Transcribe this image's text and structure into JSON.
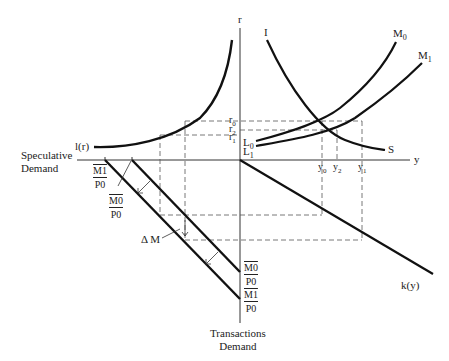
{
  "diagram": {
    "axes": {
      "vertical_top_label": "r",
      "horizontal_right_label": "y",
      "left_caption": [
        "Speculative",
        "Demand"
      ],
      "bottom_caption": [
        "Transactions",
        "Demand"
      ]
    },
    "curves": {
      "liquidity_pref": "l(r)",
      "investment": "I",
      "saving": "S",
      "money_0": "M",
      "money_0_sub": "0",
      "money_1": "M",
      "money_1_sub": "1",
      "lm0": "L",
      "lm0_sub": "0",
      "lm1": "L",
      "lm1_sub": "1",
      "transactions": "k(y)"
    },
    "interest_rates": [
      {
        "base": "r",
        "sub": "0"
      },
      {
        "base": "r",
        "sub": "2"
      },
      {
        "base": "r",
        "sub": "1"
      }
    ],
    "incomes": [
      {
        "base": "y",
        "sub": "0"
      },
      {
        "base": "y",
        "sub": "2"
      },
      {
        "base": "y",
        "sub": "1"
      }
    ],
    "fractions": {
      "m1_p0_left": {
        "num": "M1",
        "den": "P0"
      },
      "m0_p0_left": {
        "num": "M0",
        "den": "P0"
      },
      "m0_p0_bottom": {
        "num": "M0",
        "den": "P0"
      },
      "m1_p0_bottom": {
        "num": "M1",
        "den": "P0"
      }
    },
    "delta_label": "Δ M"
  }
}
